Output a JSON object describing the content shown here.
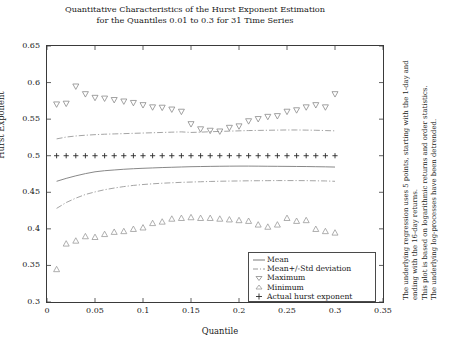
{
  "title": {
    "line1": "Quantitative Characteristics of the Hurst Exponent Estimation",
    "line2": "for the Quantiles 0.01 to 0.3 for 31 Time Series"
  },
  "axes": {
    "ylabel": "Hurst Exponent",
    "xlabel": "Quantile",
    "yticks": [
      "0.3",
      "0.35",
      "0.4",
      "0.45",
      "0.5",
      "0.55",
      "0.6",
      "0.65"
    ],
    "xticks": [
      "0",
      "0.05",
      "0.1",
      "0.15",
      "0.2",
      "0.25",
      "0.3",
      "0.35"
    ]
  },
  "legend": {
    "items": [
      {
        "label": "Mean",
        "symbol": "solid-line"
      },
      {
        "label": "Mean+/-Std deviation",
        "symbol": "dashdot-line"
      },
      {
        "label": "Maximum",
        "symbol": "down-triangle"
      },
      {
        "label": "Minimum",
        "symbol": "up-triangle"
      },
      {
        "label": "Actual hurst exponent",
        "symbol": "plus"
      }
    ]
  },
  "notes": {
    "line1": "The underlying regression uses 5 points, starting with the 1-day and",
    "line2": "ending with the 16-day returns.",
    "line3": "This plot is based on logarithmic returns and order statistics.",
    "line4": "The underlying log-processes have been detrended."
  },
  "colors": {
    "frame": "#3a3a3a",
    "mean": "#7a7a7a",
    "std": "#9a9a9a",
    "maximum": "#8a8a8a",
    "minimum": "#9a9a9a",
    "actual": "#2a2a2a"
  },
  "chart_data": {
    "type": "line",
    "title": "Quantitative Characteristics of the Hurst Exponent Estimation for the Quantiles 0.01 to 0.3 for 31 Time Series",
    "xlabel": "Quantile",
    "ylabel": "Hurst Exponent",
    "xlim": [
      0,
      0.35
    ],
    "ylim": [
      0.3,
      0.65
    ],
    "grid": false,
    "legend_position": "lower-right-inside",
    "x": [
      0.01,
      0.02,
      0.03,
      0.04,
      0.05,
      0.06,
      0.07,
      0.08,
      0.09,
      0.1,
      0.11,
      0.12,
      0.13,
      0.14,
      0.15,
      0.16,
      0.17,
      0.18,
      0.19,
      0.2,
      0.21,
      0.22,
      0.23,
      0.24,
      0.25,
      0.26,
      0.27,
      0.28,
      0.29,
      0.3
    ],
    "series": [
      {
        "name": "Mean",
        "style": "solid",
        "values": [
          0.465,
          0.469,
          0.4725,
          0.4755,
          0.478,
          0.4795,
          0.4805,
          0.4815,
          0.4822,
          0.4828,
          0.4833,
          0.4838,
          0.4842,
          0.4846,
          0.485,
          0.4852,
          0.4854,
          0.4856,
          0.4857,
          0.4858,
          0.4858,
          0.4857,
          0.4856,
          0.4855,
          0.4854,
          0.4853,
          0.4852,
          0.485,
          0.4848,
          0.4845
        ]
      },
      {
        "name": "Mean+Std deviation",
        "style": "dashdot",
        "values": [
          0.523,
          0.5255,
          0.527,
          0.528,
          0.5288,
          0.5294,
          0.5298,
          0.5302,
          0.5306,
          0.531,
          0.5314,
          0.5318,
          0.5322,
          0.5326,
          0.5318,
          0.5322,
          0.5328,
          0.5332,
          0.5336,
          0.534,
          0.5344,
          0.5346,
          0.5348,
          0.535,
          0.5352,
          0.5352,
          0.535,
          0.5348,
          0.5344,
          0.534
        ]
      },
      {
        "name": "Mean-Std deviation",
        "style": "dashdot",
        "values": [
          0.428,
          0.436,
          0.442,
          0.447,
          0.4505,
          0.4535,
          0.4558,
          0.4578,
          0.4594,
          0.4606,
          0.4616,
          0.4624,
          0.463,
          0.4636,
          0.464,
          0.4644,
          0.4648,
          0.4651,
          0.4653,
          0.4655,
          0.4657,
          0.4658,
          0.4659,
          0.466,
          0.466,
          0.466,
          0.4659,
          0.4657,
          0.4655,
          0.465
        ]
      },
      {
        "name": "Maximum",
        "style": "markers",
        "marker": "down-triangle",
        "values": [
          0.57,
          0.571,
          0.5945,
          0.584,
          0.579,
          0.578,
          0.576,
          0.574,
          0.572,
          0.569,
          0.566,
          0.5655,
          0.563,
          0.56,
          0.543,
          0.536,
          0.534,
          0.533,
          0.538,
          0.54,
          0.547,
          0.55,
          0.553,
          0.554,
          0.56,
          0.562,
          0.566,
          0.569,
          0.566,
          0.584
        ]
      },
      {
        "name": "Minimum",
        "style": "markers",
        "marker": "up-triangle",
        "values": [
          0.345,
          0.38,
          0.384,
          0.39,
          0.389,
          0.393,
          0.396,
          0.397,
          0.4,
          0.402,
          0.408,
          0.41,
          0.414,
          0.415,
          0.416,
          0.415,
          0.415,
          0.414,
          0.413,
          0.412,
          0.411,
          0.406,
          0.403,
          0.406,
          0.415,
          0.411,
          0.412,
          0.4,
          0.397,
          0.395
        ]
      },
      {
        "name": "Actual hurst exponent",
        "style": "markers",
        "marker": "plus",
        "values": [
          0.5,
          0.5,
          0.5,
          0.5,
          0.5,
          0.5,
          0.5,
          0.5,
          0.5,
          0.5,
          0.5,
          0.5,
          0.5,
          0.5,
          0.5,
          0.5,
          0.5,
          0.5,
          0.5,
          0.5,
          0.5,
          0.5,
          0.5,
          0.5,
          0.5,
          0.5,
          0.5,
          0.5,
          0.5,
          0.5
        ]
      }
    ]
  }
}
